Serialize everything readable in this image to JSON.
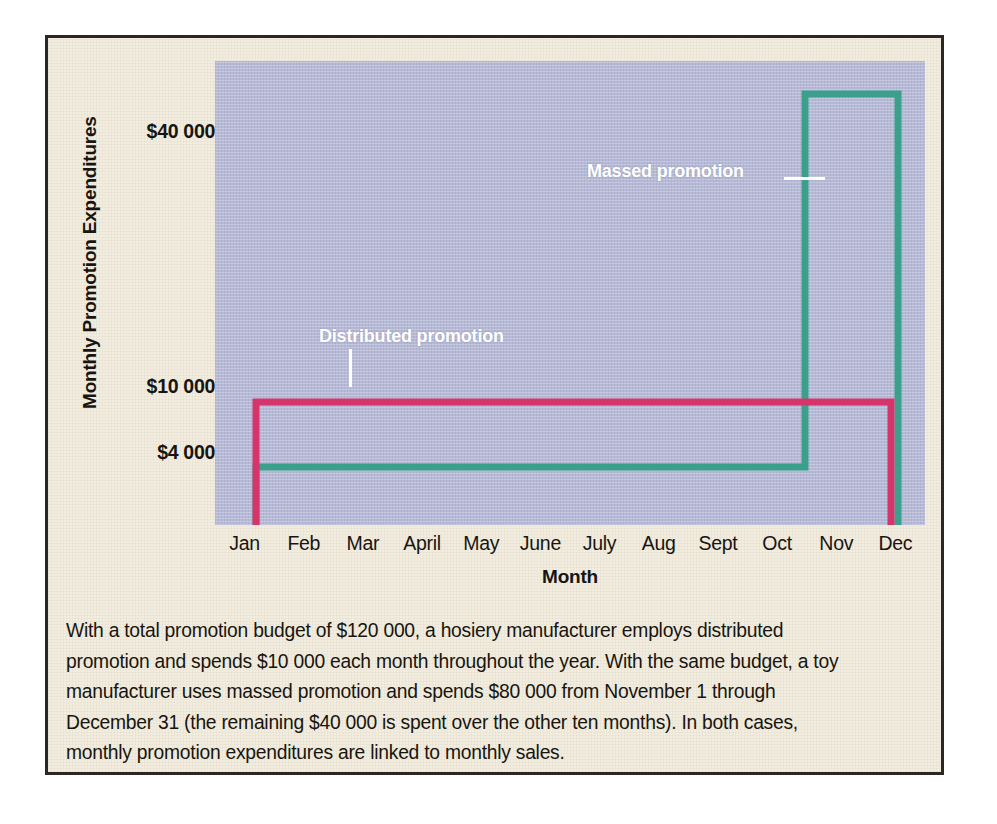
{
  "figure": {
    "caption_lines": [
      "With a total promotion budget of $120 000, a hosiery manufacturer employs distributed",
      "promotion and spends $10 000 each month throughout the year.  With the same budget, a toy",
      "manufacturer uses massed promotion and spends $80 000 from November 1 through",
      "December 31 (the remaining $40 000 is spent over the other ten months).  In both cases,",
      "monthly promotion expenditures are linked to monthly sales."
    ],
    "background_color": "#F2EDDF",
    "border_color": "#2a2724"
  },
  "chart_data": {
    "type": "line",
    "title": "",
    "xlabel": "Month",
    "ylabel": "Monthly Promotion Expenditures",
    "plot_background": "#B6BAD6",
    "grid": false,
    "legend_position": "inline-annotations",
    "categories": [
      "Jan",
      "Feb",
      "Mar",
      "April",
      "May",
      "June",
      "July",
      "Aug",
      "Sept",
      "Oct",
      "Nov",
      "Dec"
    ],
    "ytick_labels": [
      "$40 000",
      "$10 000",
      "$4 000"
    ],
    "ytick_values": [
      40000,
      10000,
      4000
    ],
    "ylim": [
      0,
      44000
    ],
    "series": [
      {
        "name": "Distributed promotion",
        "color": "#D6356B",
        "style": "step",
        "values": [
          10000,
          10000,
          10000,
          10000,
          10000,
          10000,
          10000,
          10000,
          10000,
          10000,
          10000,
          10000
        ]
      },
      {
        "name": "Massed promotion",
        "color": "#3AA08C",
        "style": "step",
        "values": [
          4000,
          4000,
          4000,
          4000,
          4000,
          4000,
          4000,
          4000,
          4000,
          4000,
          40000,
          40000
        ]
      }
    ],
    "annotations": [
      {
        "text": "Massed promotion",
        "series": "Massed promotion",
        "color": "#ffffff"
      },
      {
        "text": "Distributed promotion",
        "series": "Distributed promotion",
        "color": "#ffffff"
      }
    ]
  }
}
